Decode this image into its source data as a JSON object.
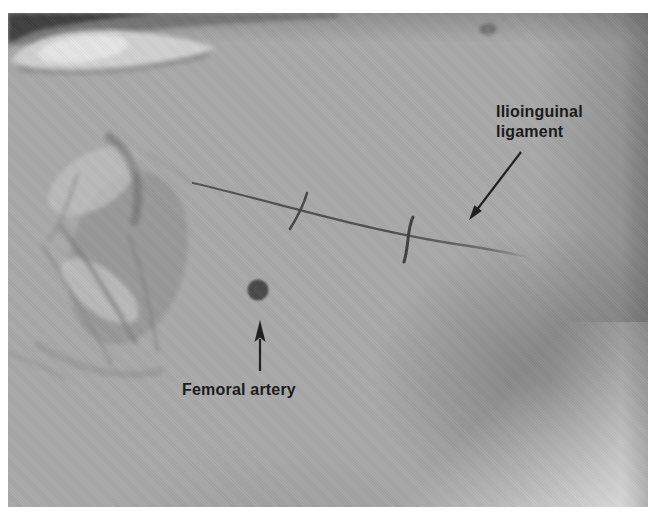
{
  "figure": {
    "kind": "annotated clinical photograph of the inguinal region",
    "labels": [
      {
        "id": "ilioinguinal",
        "text": "Ilioinguinal ligament"
      },
      {
        "id": "femoral",
        "text": "Femoral artery"
      }
    ],
    "markers": {
      "ligament_line": "drawn skin line with two cross ticks",
      "femoral_dot": "filled circle marking the femoral artery pulse point"
    }
  },
  "colors": {
    "page_bg": "#ffffff",
    "skin_base": "#a9a9a9",
    "annotation_ink": "#1e1e1e",
    "skin_line": "#4e4e4e",
    "artery_dot": "#484848"
  }
}
